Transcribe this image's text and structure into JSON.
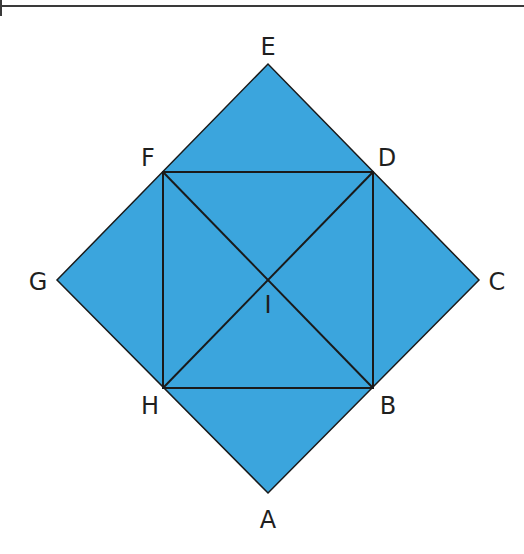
{
  "diagram": {
    "type": "geometric-figure",
    "fill_color": "#3ba5dd",
    "stroke_color": "#1a1a1a",
    "points": {
      "A": {
        "label": "A",
        "x": 268,
        "y": 493
      },
      "B": {
        "label": "B",
        "x": 373,
        "y": 388
      },
      "C": {
        "label": "C",
        "x": 479,
        "y": 280
      },
      "D": {
        "label": "D",
        "x": 373,
        "y": 172
      },
      "E": {
        "label": "E",
        "x": 268,
        "y": 64
      },
      "F": {
        "label": "F",
        "x": 163,
        "y": 172
      },
      "G": {
        "label": "G",
        "x": 57,
        "y": 280
      },
      "H": {
        "label": "H",
        "x": 163,
        "y": 388
      },
      "I": {
        "label": "I",
        "x": 268,
        "y": 280
      }
    },
    "outer_square": [
      "A",
      "C",
      "E",
      "G"
    ],
    "inner_square": [
      "B",
      "D",
      "F",
      "H"
    ],
    "diagonals": [
      [
        "F",
        "B"
      ],
      [
        "D",
        "H"
      ]
    ]
  }
}
